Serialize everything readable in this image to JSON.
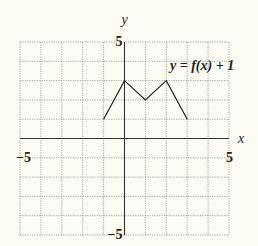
{
  "chart_data": {
    "type": "line",
    "title": "",
    "annotation": "y = f(x) + 1",
    "xlabel": "x",
    "ylabel": "y",
    "xlim": [
      -5,
      5
    ],
    "ylim": [
      -5,
      5
    ],
    "grid": true,
    "tick_labels": {
      "x_min": "−5",
      "x_max": "5",
      "y_min": "−5",
      "y_max": "5"
    },
    "series": [
      {
        "name": "y = f(x) + 1",
        "x": [
          -1,
          0,
          1,
          2,
          3
        ],
        "y": [
          1,
          3,
          2,
          3,
          1
        ]
      }
    ]
  },
  "colors": {
    "background": "#fdfcf4",
    "grid": "#8a8a8a",
    "axis": "#333333",
    "curve": "#222222"
  }
}
